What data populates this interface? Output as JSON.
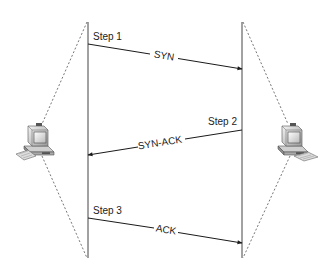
{
  "diagram": {
    "colors": {
      "line": "#1a1a1a",
      "timeline": "#555555",
      "dashed": "#777777",
      "text": "#222222",
      "background": "#ffffff"
    },
    "hosts": [
      {
        "id": "left",
        "label": "",
        "icon": "desktop-computer-icon"
      },
      {
        "id": "right",
        "label": "",
        "icon": "desktop-computer-icon"
      }
    ],
    "steps": [
      {
        "label": "Step 1",
        "message": "SYN",
        "direction": "left-to-right"
      },
      {
        "label": "Step 2",
        "message": "SYN-ACK",
        "direction": "right-to-left"
      },
      {
        "label": "Step 3",
        "message": "ACK",
        "direction": "left-to-right"
      }
    ]
  }
}
